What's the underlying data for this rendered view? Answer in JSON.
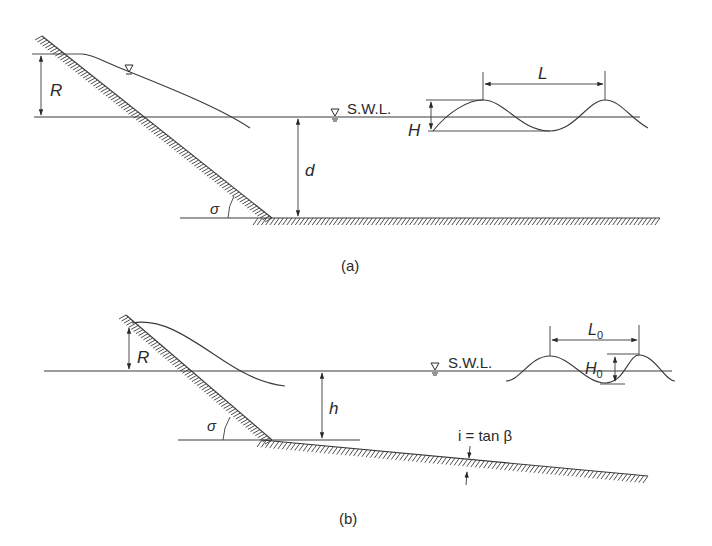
{
  "diagrams": [
    {
      "id": "a",
      "caption": "(a)",
      "labels": {
        "runup": "R",
        "depth": "d",
        "slope_angle": "σ",
        "wave_height": "H",
        "wave_length": "L",
        "swl": "S.W.L."
      },
      "icons": [
        "water-level-triangle-icon",
        "water-level-triangle-icon"
      ]
    },
    {
      "id": "b",
      "caption": "(b)",
      "labels": {
        "runup": "R",
        "depth": "h",
        "slope_angle": "σ",
        "wave_height": "H",
        "wave_height_sub": "0",
        "wave_length": "L",
        "wave_length_sub": "0",
        "swl": "S.W.L.",
        "bed_slope": "i = tan β"
      },
      "icons": [
        "water-level-triangle-icon"
      ]
    }
  ],
  "colors": {
    "ink": "#3a3a3a",
    "background": "#ffffff"
  }
}
